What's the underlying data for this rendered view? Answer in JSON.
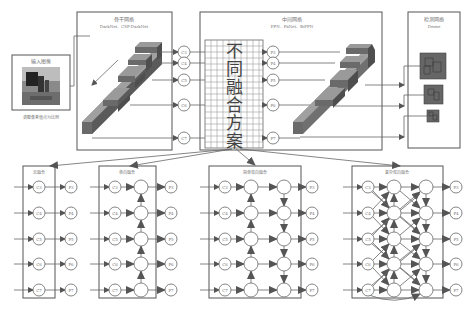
{
  "input": {
    "title": "输入图像",
    "caption": "调整像素值点为比例"
  },
  "backbone": {
    "title": "骨干网络",
    "subtitle": "DarkNet、CSP-DarkNet"
  },
  "neck": {
    "title": "中间网络",
    "subtitle": "FPN、PaNet、BiFPN"
  },
  "head": {
    "title": "检测网络",
    "subtitle": "Dense"
  },
  "fusion": {
    "chars": [
      "不",
      "同",
      "融",
      "合",
      "方",
      "案"
    ]
  },
  "c_nodes": [
    "C3",
    "C4",
    "C5",
    "C6",
    "C7"
  ],
  "p_nodes": [
    "P3",
    "P4",
    "P5",
    "P6",
    "P7"
  ],
  "panels": [
    {
      "title": "无融合"
    },
    {
      "title": "单向融合"
    },
    {
      "title": "简单双向融合"
    },
    {
      "title": "复杂双向融合"
    }
  ]
}
